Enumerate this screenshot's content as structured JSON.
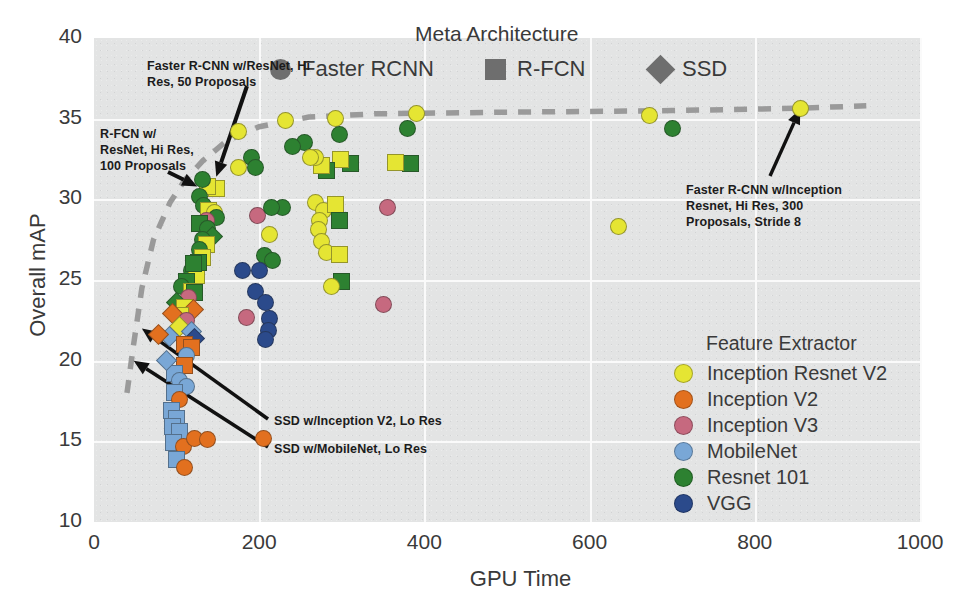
{
  "chart_data": {
    "type": "scatter",
    "title": "",
    "xlabel": "GPU Time",
    "ylabel": "Overall mAP",
    "xlim": [
      0,
      1000
    ],
    "ylim": [
      10,
      40
    ],
    "xticks": [
      0,
      200,
      400,
      600,
      800,
      1000
    ],
    "yticks": [
      10,
      15,
      20,
      25,
      30,
      35,
      40
    ],
    "grid": true,
    "legend_position": "right-inside",
    "marker_shape_meaning": "meta architecture",
    "marker_color_meaning": "feature extractor",
    "meta_architecture_legend": {
      "title": "Meta Architecture",
      "items": [
        {
          "label": "Faster RCNN",
          "shape": "circle",
          "color": "#6e6e6e"
        },
        {
          "label": "R-FCN",
          "shape": "square",
          "color": "#6e6e6e"
        },
        {
          "label": "SSD",
          "shape": "diamond",
          "color": "#6e6e6e"
        }
      ]
    },
    "feature_extractor_legend": {
      "title": "Feature Extractor",
      "items": [
        {
          "label": "Inception Resnet V2",
          "color": "#e5e533"
        },
        {
          "label": "Inception V2",
          "color": "#e2701f"
        },
        {
          "label": "Inception V3",
          "color": "#c6697f"
        },
        {
          "label": "MobileNet",
          "color": "#79a7d6"
        },
        {
          "label": "Resnet 101",
          "color": "#2d8131"
        },
        {
          "label": "VGG",
          "color": "#2b4a8b"
        }
      ]
    },
    "annotations": [
      {
        "id": "faster-rcnn-resnet-hires-50",
        "text": "Faster R-CNN w/ResNet, Hi\nRes, 50 Proposals",
        "points_to_x": 148,
        "points_to_y": 31.4
      },
      {
        "id": "rfcn-resnet-hires-100",
        "text": "R-FCN w/\nResNet, Hi Res,\n100 Proposals",
        "points_to_x": 125,
        "points_to_y": 30.8
      },
      {
        "id": "faster-rcnn-inception-resnet-hires-300",
        "text": "Faster R-CNN w/Inception\nResnet, Hi Res, 300\nProposals, Stride 8",
        "points_to_x": 855,
        "points_to_y": 35.6
      },
      {
        "id": "ssd-inception-v2-lores",
        "text": "SSD w/Inception V2, Lo Res",
        "points_to_x": 58,
        "points_to_y": 22.0
      },
      {
        "id": "ssd-mobilenet-lores",
        "text": "SSD w/MobileNet, Lo Res",
        "points_to_x": 48,
        "points_to_y": 20.0
      }
    ],
    "pareto_frontier": {
      "style": "dashed",
      "color": "#9a9a9a",
      "points": [
        [
          40,
          18.0
        ],
        [
          48,
          21.0
        ],
        [
          58,
          24.5
        ],
        [
          72,
          27.5
        ],
        [
          92,
          29.8
        ],
        [
          110,
          31.2
        ],
        [
          132,
          32.4
        ],
        [
          160,
          33.6
        ],
        [
          200,
          34.5
        ],
        [
          260,
          35.1
        ],
        [
          340,
          35.3
        ],
        [
          500,
          35.4
        ],
        [
          700,
          35.5
        ],
        [
          855,
          35.65
        ],
        [
          935,
          35.8
        ]
      ]
    },
    "points": [
      {
        "x": 855,
        "y": 35.6,
        "c": "#e5e533",
        "s": "circle"
      },
      {
        "x": 672,
        "y": 35.2,
        "c": "#e5e533",
        "s": "circle"
      },
      {
        "x": 390,
        "y": 35.3,
        "c": "#e5e533",
        "s": "circle"
      },
      {
        "x": 292,
        "y": 35.0,
        "c": "#e5e533",
        "s": "circle"
      },
      {
        "x": 232,
        "y": 34.9,
        "c": "#e5e533",
        "s": "circle"
      },
      {
        "x": 175,
        "y": 34.2,
        "c": "#e5e533",
        "s": "circle"
      },
      {
        "x": 700,
        "y": 34.4,
        "c": "#2d8131",
        "s": "circle"
      },
      {
        "x": 380,
        "y": 34.4,
        "c": "#2d8131",
        "s": "circle"
      },
      {
        "x": 297,
        "y": 34.0,
        "c": "#2d8131",
        "s": "circle"
      },
      {
        "x": 255,
        "y": 33.5,
        "c": "#2d8131",
        "s": "circle"
      },
      {
        "x": 240,
        "y": 33.3,
        "c": "#2d8131",
        "s": "circle"
      },
      {
        "x": 191,
        "y": 32.6,
        "c": "#2d8131",
        "s": "circle"
      },
      {
        "x": 175,
        "y": 32.0,
        "c": "#e5e533",
        "s": "circle"
      },
      {
        "x": 196,
        "y": 32.0,
        "c": "#2d8131",
        "s": "circle"
      },
      {
        "x": 383,
        "y": 32.2,
        "c": "#2d8131",
        "s": "square"
      },
      {
        "x": 365,
        "y": 32.3,
        "c": "#e5e533",
        "s": "square"
      },
      {
        "x": 310,
        "y": 32.2,
        "c": "#2d8131",
        "s": "square"
      },
      {
        "x": 298,
        "y": 32.5,
        "c": "#e5e533",
        "s": "square"
      },
      {
        "x": 282,
        "y": 31.8,
        "c": "#2d8131",
        "s": "square"
      },
      {
        "x": 275,
        "y": 32.1,
        "c": "#e5e533",
        "s": "square"
      },
      {
        "x": 268,
        "y": 32.6,
        "c": "#e5e533",
        "s": "circle"
      },
      {
        "x": 262,
        "y": 32.6,
        "c": "#e5e533",
        "s": "circle"
      },
      {
        "x": 148,
        "y": 30.7,
        "c": "#e5e533",
        "s": "square"
      },
      {
        "x": 137,
        "y": 30.8,
        "c": "#e5e533",
        "s": "square"
      },
      {
        "x": 131,
        "y": 31.2,
        "c": "#2d8131",
        "s": "circle"
      },
      {
        "x": 128,
        "y": 30.2,
        "c": "#2d8131",
        "s": "circle"
      },
      {
        "x": 133,
        "y": 29.6,
        "c": "#2d8131",
        "s": "circle"
      },
      {
        "x": 139,
        "y": 29.3,
        "c": "#e5e533",
        "s": "square"
      },
      {
        "x": 146,
        "y": 29.2,
        "c": "#e5e533",
        "s": "circle"
      },
      {
        "x": 148,
        "y": 28.9,
        "c": "#2d8131",
        "s": "circle"
      },
      {
        "x": 136,
        "y": 28.7,
        "c": "#c6697f",
        "s": "circle"
      },
      {
        "x": 128,
        "y": 28.5,
        "c": "#2d8131",
        "s": "square"
      },
      {
        "x": 138,
        "y": 28.2,
        "c": "#2d8131",
        "s": "circle"
      },
      {
        "x": 143,
        "y": 27.7,
        "c": "#2d8131",
        "s": "diamond"
      },
      {
        "x": 131,
        "y": 27.5,
        "c": "#2d8131",
        "s": "circle"
      },
      {
        "x": 136,
        "y": 27.2,
        "c": "#e5e533",
        "s": "square"
      },
      {
        "x": 128,
        "y": 26.9,
        "c": "#2d8131",
        "s": "circle"
      },
      {
        "x": 131,
        "y": 26.4,
        "c": "#e5e533",
        "s": "square"
      },
      {
        "x": 127,
        "y": 26.1,
        "c": "#2d8131",
        "s": "square"
      },
      {
        "x": 120,
        "y": 26.0,
        "c": "#2d8131",
        "s": "square"
      },
      {
        "x": 118,
        "y": 25.6,
        "c": "#2d8131",
        "s": "circle"
      },
      {
        "x": 124,
        "y": 25.3,
        "c": "#e5e533",
        "s": "square"
      },
      {
        "x": 112,
        "y": 24.9,
        "c": "#2d8131",
        "s": "square"
      },
      {
        "x": 106,
        "y": 24.6,
        "c": "#2d8131",
        "s": "circle"
      },
      {
        "x": 118,
        "y": 24.3,
        "c": "#e5e533",
        "s": "square"
      },
      {
        "x": 122,
        "y": 24.2,
        "c": "#2d8131",
        "s": "square"
      },
      {
        "x": 114,
        "y": 23.9,
        "c": "#c6697f",
        "s": "circle"
      },
      {
        "x": 100,
        "y": 23.6,
        "c": "#2d8131",
        "s": "diamond"
      },
      {
        "x": 110,
        "y": 23.3,
        "c": "#e5e533",
        "s": "square"
      },
      {
        "x": 120,
        "y": 23.2,
        "c": "#e2701f",
        "s": "diamond"
      },
      {
        "x": 105,
        "y": 22.8,
        "c": "#e5e533",
        "s": "square"
      },
      {
        "x": 95,
        "y": 22.9,
        "c": "#e2701f",
        "s": "diamond"
      },
      {
        "x": 112,
        "y": 22.5,
        "c": "#c6697f",
        "s": "circle"
      },
      {
        "x": 104,
        "y": 22.1,
        "c": "#e5e533",
        "s": "diamond"
      },
      {
        "x": 118,
        "y": 21.8,
        "c": "#79a7d6",
        "s": "diamond"
      },
      {
        "x": 122,
        "y": 21.4,
        "c": "#2b4a8b",
        "s": "diamond"
      },
      {
        "x": 92,
        "y": 21.5,
        "c": "#79a7d6",
        "s": "diamond"
      },
      {
        "x": 110,
        "y": 21.0,
        "c": "#e2701f",
        "s": "square"
      },
      {
        "x": 118,
        "y": 20.8,
        "c": "#e2701f",
        "s": "square"
      },
      {
        "x": 112,
        "y": 20.3,
        "c": "#79a7d6",
        "s": "circle"
      },
      {
        "x": 110,
        "y": 19.7,
        "c": "#e2701f",
        "s": "square"
      },
      {
        "x": 98,
        "y": 19.2,
        "c": "#79a7d6",
        "s": "square"
      },
      {
        "x": 104,
        "y": 18.8,
        "c": "#79a7d6",
        "s": "circle"
      },
      {
        "x": 112,
        "y": 18.4,
        "c": "#79a7d6",
        "s": "circle"
      },
      {
        "x": 98,
        "y": 18.0,
        "c": "#79a7d6",
        "s": "square"
      },
      {
        "x": 104,
        "y": 17.6,
        "c": "#e2701f",
        "s": "circle"
      },
      {
        "x": 94,
        "y": 16.9,
        "c": "#79a7d6",
        "s": "square"
      },
      {
        "x": 100,
        "y": 16.4,
        "c": "#79a7d6",
        "s": "square"
      },
      {
        "x": 95,
        "y": 15.9,
        "c": "#79a7d6",
        "s": "square"
      },
      {
        "x": 103,
        "y": 15.6,
        "c": "#79a7d6",
        "s": "square"
      },
      {
        "x": 96,
        "y": 14.9,
        "c": "#79a7d6",
        "s": "square"
      },
      {
        "x": 108,
        "y": 14.7,
        "c": "#e2701f",
        "s": "circle"
      },
      {
        "x": 122,
        "y": 15.2,
        "c": "#e2701f",
        "s": "circle"
      },
      {
        "x": 138,
        "y": 15.1,
        "c": "#e2701f",
        "s": "circle"
      },
      {
        "x": 205,
        "y": 15.2,
        "c": "#e2701f",
        "s": "circle"
      },
      {
        "x": 100,
        "y": 13.9,
        "c": "#79a7d6",
        "s": "square"
      },
      {
        "x": 110,
        "y": 13.4,
        "c": "#e2701f",
        "s": "circle"
      },
      {
        "x": 88,
        "y": 20.0,
        "c": "#79a7d6",
        "s": "diamond"
      },
      {
        "x": 78,
        "y": 21.6,
        "c": "#e2701f",
        "s": "diamond"
      },
      {
        "x": 215,
        "y": 29.5,
        "c": "#2d8131",
        "s": "circle"
      },
      {
        "x": 228,
        "y": 29.5,
        "c": "#2d8131",
        "s": "circle"
      },
      {
        "x": 198,
        "y": 29.0,
        "c": "#c6697f",
        "s": "circle"
      },
      {
        "x": 212,
        "y": 27.8,
        "c": "#e5e533",
        "s": "circle"
      },
      {
        "x": 206,
        "y": 26.5,
        "c": "#2d8131",
        "s": "circle"
      },
      {
        "x": 216,
        "y": 26.2,
        "c": "#2d8131",
        "s": "circle"
      },
      {
        "x": 196,
        "y": 24.3,
        "c": "#2b4a8b",
        "s": "circle"
      },
      {
        "x": 208,
        "y": 23.6,
        "c": "#2b4a8b",
        "s": "circle"
      },
      {
        "x": 212,
        "y": 22.6,
        "c": "#2b4a8b",
        "s": "circle"
      },
      {
        "x": 211,
        "y": 21.9,
        "c": "#2b4a8b",
        "s": "circle"
      },
      {
        "x": 208,
        "y": 21.3,
        "c": "#2b4a8b",
        "s": "circle"
      },
      {
        "x": 185,
        "y": 22.7,
        "c": "#c6697f",
        "s": "circle"
      },
      {
        "x": 180,
        "y": 25.6,
        "c": "#2b4a8b",
        "s": "circle"
      },
      {
        "x": 200,
        "y": 25.6,
        "c": "#2b4a8b",
        "s": "circle"
      },
      {
        "x": 268,
        "y": 29.8,
        "c": "#e5e533",
        "s": "circle"
      },
      {
        "x": 278,
        "y": 29.3,
        "c": "#e5e533",
        "s": "circle"
      },
      {
        "x": 273,
        "y": 28.7,
        "c": "#e5e533",
        "s": "circle"
      },
      {
        "x": 272,
        "y": 28.1,
        "c": "#e5e533",
        "s": "circle"
      },
      {
        "x": 276,
        "y": 27.4,
        "c": "#e5e533",
        "s": "circle"
      },
      {
        "x": 282,
        "y": 26.7,
        "c": "#e5e533",
        "s": "circle"
      },
      {
        "x": 292,
        "y": 29.7,
        "c": "#e5e533",
        "s": "square"
      },
      {
        "x": 297,
        "y": 28.7,
        "c": "#2d8131",
        "s": "square"
      },
      {
        "x": 297,
        "y": 26.6,
        "c": "#e5e533",
        "s": "square"
      },
      {
        "x": 300,
        "y": 24.9,
        "c": "#2d8131",
        "s": "square"
      },
      {
        "x": 288,
        "y": 24.6,
        "c": "#e5e533",
        "s": "circle"
      },
      {
        "x": 355,
        "y": 29.5,
        "c": "#c6697f",
        "s": "circle"
      },
      {
        "x": 350,
        "y": 23.5,
        "c": "#c6697f",
        "s": "circle"
      },
      {
        "x": 635,
        "y": 28.3,
        "c": "#e5e533",
        "s": "circle"
      }
    ]
  }
}
